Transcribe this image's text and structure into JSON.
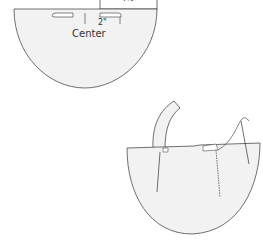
{
  "figure": {
    "top_drawing": {
      "rect_label": "4½",
      "dimension_label": "2\"",
      "center_label": "Center"
    },
    "bottom_drawing": {
      "description": "Assembled pocket with handle strap and sewing needle"
    },
    "caption": ""
  },
  "colors": {
    "fill": "#f2f2f2",
    "stroke": "#333333",
    "background": "#ffffff"
  }
}
